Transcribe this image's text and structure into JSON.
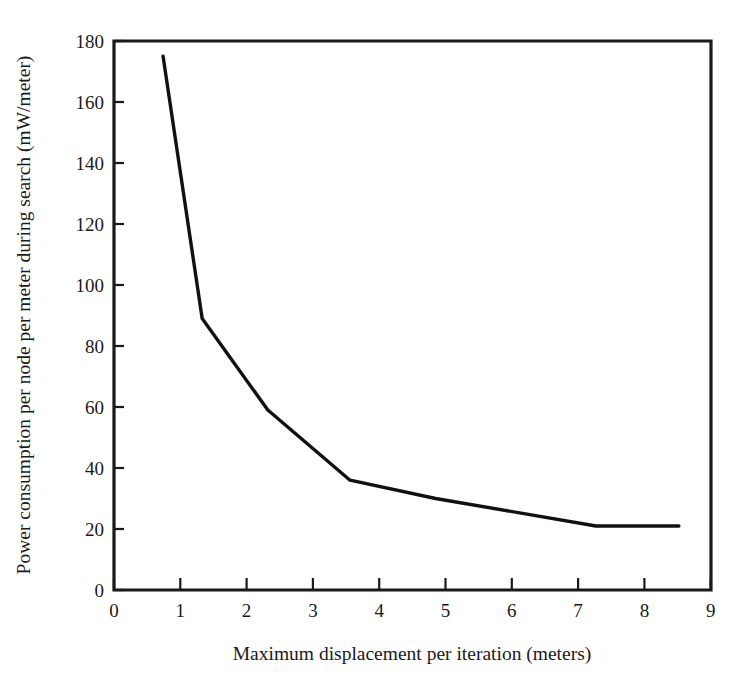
{
  "chart_data": {
    "type": "line",
    "title": "",
    "subtitle": "",
    "xlabel": "Maximum displacement per iteration (meters)",
    "ylabel": "Power consumption per node per meter during search (mW/meter)",
    "xlim": [
      0,
      9
    ],
    "ylim": [
      0,
      180
    ],
    "xticks": [
      0,
      1,
      2,
      3,
      4,
      5,
      6,
      7,
      8,
      9
    ],
    "yticks": [
      0,
      20,
      40,
      60,
      80,
      100,
      120,
      140,
      160,
      180
    ],
    "xtick_labels": [
      "0",
      "1",
      "2",
      "3",
      "4",
      "5",
      "6",
      "7",
      "8",
      "9"
    ],
    "ytick_labels": [
      "0",
      "20",
      "40",
      "60",
      "80",
      "100",
      "120",
      "140",
      "160",
      "180"
    ],
    "grid": false,
    "legend": null,
    "legend_position": "none",
    "line_color": "#111111",
    "series": [
      {
        "name": "Power consumption per node per meter during search",
        "x": [
          0.74,
          1.33,
          2.32,
          3.56,
          4.85,
          7.27,
          8.52
        ],
        "y": [
          175,
          89,
          59,
          36,
          30,
          21,
          21
        ]
      }
    ],
    "annotations": []
  },
  "axes": {
    "y_title": "Power consumption per node per meter during search (mW/meter)",
    "x_title": "Maximum displacement per iteration (meters)",
    "x_tick_labels": [
      "0",
      "1",
      "2",
      "3",
      "4",
      "5",
      "6",
      "7",
      "8",
      "9"
    ],
    "y_tick_labels": [
      "0",
      "20",
      "40",
      "60",
      "80",
      "100",
      "120",
      "140",
      "160",
      "180"
    ]
  }
}
